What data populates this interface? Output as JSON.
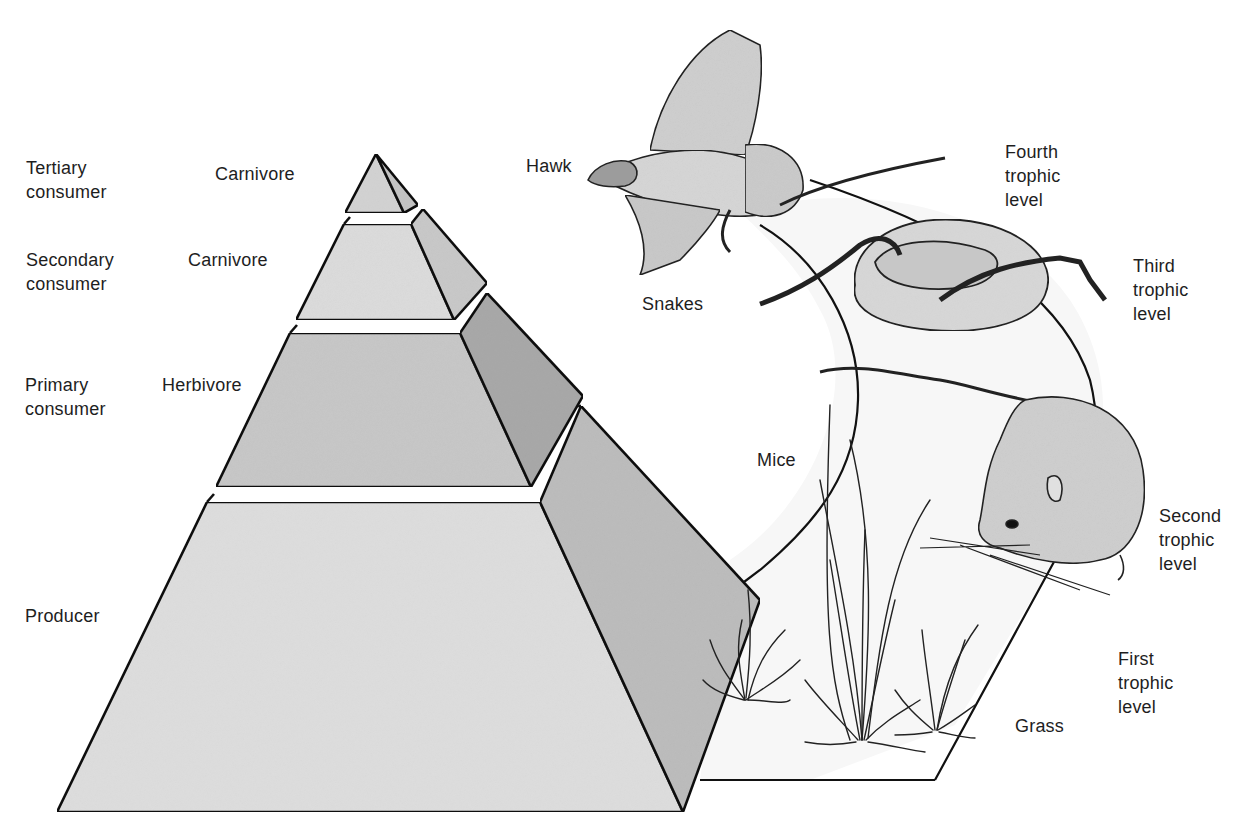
{
  "diagram": {
    "type": "ecological-pyramid-and-food-chain",
    "pyramid": {
      "tiers": [
        {
          "role": "Tertiary\nconsumer",
          "diet": "Carnivore",
          "fill": "#d3d3d3",
          "side_fill": "#c4c4c4"
        },
        {
          "role": "Secondary\nconsumer",
          "diet": "Carnivore",
          "fill": "#dcdcdc",
          "side_fill": "#c9c9c9"
        },
        {
          "role": "Primary\nconsumer",
          "diet": "Herbivore",
          "fill": "#c8c8c8",
          "side_fill": "#a9a9a9"
        },
        {
          "role": "Producer",
          "diet": "",
          "fill": "#dedede",
          "side_fill": "#bdbdbd"
        }
      ]
    },
    "food_chain": {
      "organisms": [
        {
          "name": "Hawk",
          "level": "Fourth\ntrophic\nlevel"
        },
        {
          "name": "Snakes",
          "level": "Third\ntrophic\nlevel"
        },
        {
          "name": "Mice",
          "level": "Second\ntrophic\nlevel"
        },
        {
          "name": "Grass",
          "level": "First\ntrophic\nlevel"
        }
      ],
      "band_fill": "#f7f7f7"
    },
    "colors": {
      "outline": "#111111",
      "text": "#1e1e1e",
      "background": "#ffffff"
    }
  }
}
